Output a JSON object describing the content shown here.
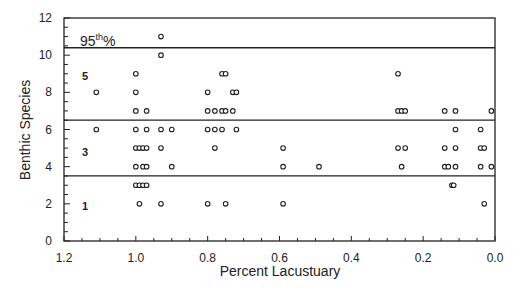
{
  "chart_data": {
    "type": "scatter",
    "title": "",
    "xlabel": "Percent Lacustuary",
    "ylabel": "Benthic Species",
    "xlim": [
      1.2,
      0.0
    ],
    "ylim": [
      0,
      12
    ],
    "x_reversed": true,
    "xticks": [
      "1.2",
      "1.0",
      "0.8",
      "0.6",
      "0.4",
      "0.2",
      "0.0"
    ],
    "xtick_values": [
      1.2,
      1.0,
      0.8,
      0.6,
      0.4,
      0.2,
      0.0
    ],
    "yticks": [
      "0",
      "2",
      "4",
      "6",
      "8",
      "10",
      "12"
    ],
    "ytick_values": [
      0,
      2,
      4,
      6,
      8,
      10,
      12
    ],
    "grid": false,
    "legend": null,
    "marker": "open-circle",
    "reference_lines": [
      {
        "name": "95th percentile",
        "y": 10.4,
        "label": "95",
        "label_sup": "th",
        "label_suffix": "%"
      },
      {
        "name": "upper threshold",
        "y": 6.5
      },
      {
        "name": "lower threshold",
        "y": 3.5
      }
    ],
    "zone_labels": [
      {
        "text": "5",
        "x": 1.15,
        "y": 8.9
      },
      {
        "text": "3",
        "x": 1.15,
        "y": 4.8
      },
      {
        "text": "1",
        "x": 1.15,
        "y": 1.9
      }
    ],
    "points": [
      [
        1.11,
        8
      ],
      [
        1.11,
        6
      ],
      [
        1.0,
        9
      ],
      [
        1.0,
        8
      ],
      [
        1.0,
        7
      ],
      [
        1.0,
        6
      ],
      [
        1.0,
        5
      ],
      [
        1.0,
        4
      ],
      [
        1.0,
        3
      ],
      [
        0.99,
        5
      ],
      [
        0.99,
        3
      ],
      [
        0.99,
        2
      ],
      [
        0.98,
        5
      ],
      [
        0.98,
        4
      ],
      [
        0.98,
        3
      ],
      [
        0.97,
        7
      ],
      [
        0.97,
        6
      ],
      [
        0.97,
        5
      ],
      [
        0.97,
        4
      ],
      [
        0.97,
        3
      ],
      [
        0.93,
        11
      ],
      [
        0.93,
        10
      ],
      [
        0.93,
        6
      ],
      [
        0.93,
        5
      ],
      [
        0.93,
        2
      ],
      [
        0.9,
        6
      ],
      [
        0.9,
        4
      ],
      [
        0.8,
        8
      ],
      [
        0.8,
        7
      ],
      [
        0.8,
        6
      ],
      [
        0.8,
        2
      ],
      [
        0.78,
        7
      ],
      [
        0.78,
        6
      ],
      [
        0.78,
        5
      ],
      [
        0.76,
        9
      ],
      [
        0.76,
        7
      ],
      [
        0.76,
        6
      ],
      [
        0.75,
        9
      ],
      [
        0.75,
        7
      ],
      [
        0.75,
        2
      ],
      [
        0.73,
        8
      ],
      [
        0.73,
        7
      ],
      [
        0.72,
        8
      ],
      [
        0.72,
        6
      ],
      [
        0.59,
        5
      ],
      [
        0.59,
        4
      ],
      [
        0.59,
        2
      ],
      [
        0.49,
        4
      ],
      [
        0.27,
        9
      ],
      [
        0.27,
        7
      ],
      [
        0.27,
        5
      ],
      [
        0.26,
        7
      ],
      [
        0.26,
        4
      ],
      [
        0.25,
        7
      ],
      [
        0.25,
        5
      ],
      [
        0.14,
        7
      ],
      [
        0.14,
        5
      ],
      [
        0.14,
        4
      ],
      [
        0.13,
        4
      ],
      [
        0.12,
        3
      ],
      [
        0.115,
        3
      ],
      [
        0.11,
        7
      ],
      [
        0.11,
        6
      ],
      [
        0.11,
        5
      ],
      [
        0.11,
        4
      ],
      [
        0.04,
        6
      ],
      [
        0.04,
        5
      ],
      [
        0.04,
        4
      ],
      [
        0.03,
        5
      ],
      [
        0.03,
        2
      ],
      [
        0.01,
        7
      ],
      [
        0.01,
        4
      ]
    ]
  },
  "labels": {
    "xlabel": "Percent Lacustuary",
    "ylabel": "Benthic Species",
    "pct_label_main": "95",
    "pct_label_sup": "th",
    "pct_label_suffix": "%"
  },
  "colors": {
    "ink": "#222222",
    "background": "#ffffff"
  }
}
